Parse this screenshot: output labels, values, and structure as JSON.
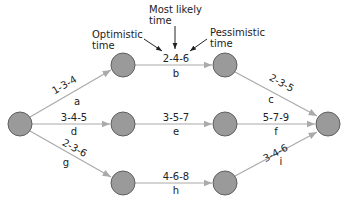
{
  "annotations": {
    "optimistic_line1": "Optimistic",
    "optimistic_line2": "time",
    "most_likely_line1": "Most likely",
    "most_likely_line2": "time",
    "pessimistic_line1": "Pessimistic",
    "pessimistic_line2": "time"
  },
  "colors": {
    "node_fill": "#9a9a9a",
    "node_stroke": "#5f5f5f",
    "edge": "#aaaaaa",
    "text": "#222222"
  },
  "activities": [
    {
      "id": "a",
      "estimate": "1-3-4"
    },
    {
      "id": "b",
      "estimate": "2-4-6"
    },
    {
      "id": "c",
      "estimate": "2-3-5"
    },
    {
      "id": "d",
      "estimate": "3-4-5"
    },
    {
      "id": "e",
      "estimate": "3-5-7"
    },
    {
      "id": "f",
      "estimate": "5-7-9"
    },
    {
      "id": "g",
      "estimate": "2-3-6"
    },
    {
      "id": "h",
      "estimate": "4-6-8"
    },
    {
      "id": "i",
      "estimate": "3-4-6"
    }
  ]
}
